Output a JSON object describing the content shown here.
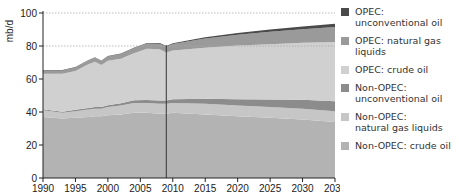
{
  "chart_data": {
    "type": "area",
    "stacked": true,
    "title": "",
    "xlabel": "",
    "ylabel": "mb/d",
    "ylim": [
      0,
      100
    ],
    "xlim": [
      1990,
      2035
    ],
    "x_ticks": [
      1990,
      1995,
      2000,
      2005,
      2010,
      2015,
      2020,
      2025,
      2030,
      2035
    ],
    "y_ticks": [
      0,
      20,
      40,
      60,
      80,
      100
    ],
    "grid": {
      "horizontal_dotted_at": [
        80,
        100
      ]
    },
    "vertical_marker_year": 2009,
    "legend_position": "right",
    "x": [
      1990,
      1993,
      1995,
      1997,
      1998,
      1999,
      2000,
      2002,
      2004,
      2006,
      2008,
      2009,
      2010,
      2015,
      2020,
      2025,
      2030,
      2035
    ],
    "series": [
      {
        "name": "Non-OPEC: crude oil",
        "color": "#b3b3b3",
        "values": [
          37,
          36,
          36.5,
          37,
          37.5,
          37.5,
          38,
          38.5,
          39.5,
          39.5,
          39,
          39,
          39.5,
          38.5,
          37.5,
          36.5,
          35.5,
          34
        ]
      },
      {
        "name": "Non-OPEC: natural gas liquids",
        "color": "#c6c6c6",
        "values": [
          4,
          3.5,
          4,
          4.5,
          4.5,
          4.5,
          5,
          5.5,
          6,
          6,
          6,
          6,
          6,
          6.5,
          6.5,
          6.5,
          6.5,
          6.5
        ]
      },
      {
        "name": "Non-OPEC: unconventional oil",
        "color": "#8c8c8c",
        "values": [
          0.7,
          0.7,
          0.8,
          0.9,
          1,
          1,
          1.1,
          1.3,
          1.6,
          1.8,
          2,
          2,
          2.2,
          3,
          3.8,
          4.6,
          5.4,
          6
        ]
      },
      {
        "name": "OPEC: crude oil",
        "color": "#d0d0d0",
        "values": [
          21.5,
          23,
          23.5,
          26.5,
          27.5,
          25.5,
          27,
          27,
          28.5,
          31,
          31,
          29,
          29.5,
          31,
          32.5,
          33.5,
          34.5,
          36
        ]
      },
      {
        "name": "OPEC: natural gas liquids",
        "color": "#9a9a9a",
        "values": [
          2,
          2,
          2.2,
          2.4,
          2.5,
          2.5,
          2.6,
          2.8,
          3,
          3.2,
          3.4,
          3.6,
          4,
          5.5,
          6.5,
          7.5,
          8.2,
          9
        ]
      },
      {
        "name": "OPEC: unconventional oil",
        "color": "#4a4a4a",
        "values": [
          0.2,
          0.2,
          0.2,
          0.2,
          0.2,
          0.2,
          0.2,
          0.3,
          0.3,
          0.3,
          0.4,
          0.4,
          0.5,
          0.8,
          1.1,
          1.4,
          1.7,
          2
        ]
      }
    ]
  },
  "legend": [
    {
      "label": "OPEC: unconventional oil",
      "color": "#4a4a4a"
    },
    {
      "label": "OPEC: natural gas liquids",
      "color": "#9a9a9a"
    },
    {
      "label": "OPEC: crude oil",
      "color": "#d0d0d0"
    },
    {
      "label": "Non-OPEC: unconventional oil",
      "color": "#8c8c8c"
    },
    {
      "label": "Non-OPEC: natural gas liquids",
      "color": "#c6c6c6"
    },
    {
      "label": "Non-OPEC: crude oil",
      "color": "#b3b3b3"
    }
  ],
  "axis": {
    "ylabel": "mb/d"
  }
}
